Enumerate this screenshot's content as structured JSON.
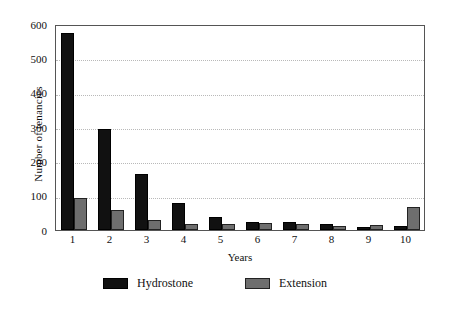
{
  "chart_data": {
    "type": "bar",
    "title": "",
    "xlabel": "Years",
    "ylabel": "Number of tenancies",
    "categories": [
      "1",
      "2",
      "3",
      "4",
      "5",
      "6",
      "7",
      "8",
      "9",
      "10"
    ],
    "series": [
      {
        "name": "Hydrostone",
        "color": "#111111",
        "values": [
          575,
          293,
          163,
          80,
          38,
          22,
          24,
          17,
          8,
          13
        ]
      },
      {
        "name": "Extension",
        "color": "#6e6e6e",
        "values": [
          93,
          58,
          28,
          18,
          18,
          20,
          17,
          13,
          14,
          67
        ]
      }
    ],
    "ylim": [
      0,
      600
    ],
    "yticks": [
      0,
      100,
      200,
      300,
      400,
      500,
      600
    ],
    "ytick_labels": [
      "0",
      "100",
      "200",
      "300",
      "400",
      "500",
      "600"
    ],
    "grid": true,
    "grid_axis": "y",
    "legend_position": "bottom",
    "legend": [
      "Hydrostone",
      "Extension"
    ]
  }
}
